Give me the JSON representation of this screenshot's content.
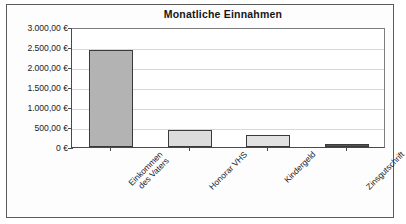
{
  "chart_data": {
    "type": "bar",
    "title": "Monatliche Einnahmen",
    "xlabel": "",
    "ylabel": "",
    "categories": [
      "Einkommen\ndes Vaters",
      "Honorar VHS",
      "Kindergeld",
      "Zinsgutschrift"
    ],
    "values": [
      2420,
      420,
      300,
      70
    ],
    "ylim": [
      0,
      3000
    ],
    "ytick_values": [
      3000,
      2500,
      2000,
      1500,
      1000,
      500,
      0
    ],
    "ytick_labels": [
      "3.000,00 €",
      "2.500,00 €",
      "2.000,00 €",
      "1.500,00 €",
      "1.000,00 €",
      "500,00 €",
      "0 €"
    ],
    "grid": true,
    "legend": "none",
    "currency": "EUR",
    "bar_colors": [
      "#b3b3b3",
      "#dcdcdc",
      "#e2e2e2",
      "#555555"
    ],
    "bar_border_color": "#3a3a3a",
    "gridline_color": "#d7d7d7",
    "axis_color": "#4a4a4a",
    "plot_background": "#ffffff"
  }
}
